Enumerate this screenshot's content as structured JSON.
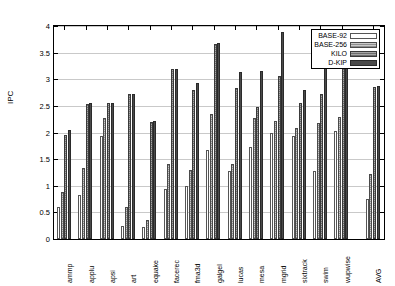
{
  "chart_data": {
    "type": "bar",
    "title": "",
    "xlabel": "",
    "ylabel": "IPC",
    "ylim": [
      0,
      4
    ],
    "ytick_step": 0.5,
    "ytick_labels": [
      "0",
      "0.5",
      "1",
      "1.5",
      "2",
      "2.5",
      "3",
      "3.5",
      "4"
    ],
    "grid": true,
    "legend_position": "top-right",
    "categories": [
      "ammp",
      "applu",
      "apsi",
      "art",
      "equake",
      "facerec",
      "fma3d",
      "galgel",
      "lucas",
      "mesa",
      "mgrid",
      "sixtrack",
      "swim",
      "wupwise",
      "AVG"
    ],
    "series": [
      {
        "name": "BASE-92",
        "values": [
          0.6,
          0.83,
          1.93,
          0.24,
          0.22,
          0.93,
          1.0,
          1.68,
          1.28,
          1.73,
          2.0,
          1.93,
          1.27,
          2.02,
          0.75
        ]
      },
      {
        "name": "BASE-256",
        "values": [
          0.89,
          1.34,
          2.27,
          0.61,
          0.35,
          1.41,
          1.3,
          2.34,
          1.4,
          2.28,
          2.22,
          2.08,
          2.17,
          2.3,
          1.22
        ]
      },
      {
        "name": "KILO",
        "values": [
          1.95,
          2.53,
          2.55,
          2.72,
          2.19,
          3.19,
          2.79,
          3.67,
          2.84,
          2.47,
          3.06,
          2.55,
          2.72,
          3.79,
          2.85
        ]
      },
      {
        "name": "D-KIP",
        "values": [
          2.04,
          2.55,
          2.56,
          2.73,
          2.21,
          3.19,
          2.93,
          3.68,
          3.13,
          3.16,
          3.89,
          2.8,
          3.55,
          3.85,
          2.88
        ]
      }
    ]
  },
  "legend": {
    "entries": [
      {
        "label": "BASE-92",
        "style": "white-open"
      },
      {
        "label": "BASE-256",
        "style": "light-hatch"
      },
      {
        "label": "KILO",
        "style": "dark-hatch"
      },
      {
        "label": "D-KIP",
        "style": "solid-dark"
      }
    ]
  },
  "axes": {
    "y_title": "IPC"
  },
  "colors": {
    "series_base92": "#ffffff",
    "series_base256": "#a8a8a8",
    "series_kilo": "#7c7c7c",
    "series_dkip": "#4a4a4a",
    "grid": "#c9c9c9",
    "axis": "#000000"
  }
}
